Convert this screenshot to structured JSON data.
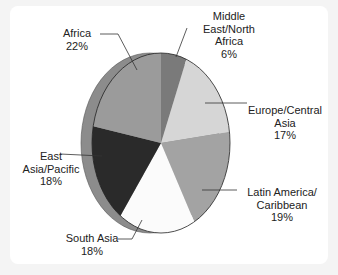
{
  "chart_data": {
    "type": "pie",
    "title": "",
    "style": "3d-tilted",
    "start_angle": "12 o'clock",
    "direction": "clockwise",
    "slices": [
      {
        "label": [
          "Middle",
          "East/North",
          "Africa"
        ],
        "value": 6,
        "value_label": "6%",
        "color": "#7a7a7a"
      },
      {
        "label": [
          "Europe/Central",
          "Asia"
        ],
        "value": 17,
        "value_label": "17%",
        "color": "#d6d6d6"
      },
      {
        "label": [
          "Latin America/",
          "Caribbean"
        ],
        "value": 19,
        "value_label": "19%",
        "color": "#a3a3a3"
      },
      {
        "label": [
          "South Asia"
        ],
        "value": 18,
        "value_label": "18%",
        "color": "#fbfbfb"
      },
      {
        "label": [
          "East",
          "Asia/Pacific"
        ],
        "value": 18,
        "value_label": "18%",
        "color": "#2a2a2a"
      },
      {
        "label": [
          "Africa"
        ],
        "value": 22,
        "value_label": "22%",
        "color": "#9b9b9b"
      }
    ],
    "side_color": "#8c8c8c"
  }
}
